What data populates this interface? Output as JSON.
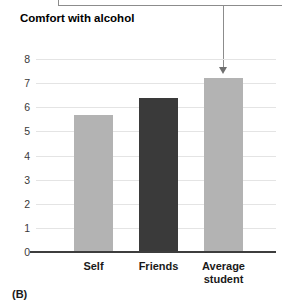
{
  "panel": {
    "label": "(B)"
  },
  "callout": {
    "text": ""
  },
  "chart_data": {
    "type": "bar",
    "title": "Comfort with alcohol",
    "xlabel": "",
    "ylabel": "Comfort with alcohol",
    "categories": [
      "Self",
      "Friends",
      "Average student"
    ],
    "values": [
      5.7,
      6.4,
      7.2
    ],
    "bar_colors": [
      "#b3b3b3",
      "#3a3a3a",
      "#b3b3b3"
    ],
    "ylim": [
      0,
      8
    ],
    "yticks": [
      0,
      1,
      2,
      3,
      4,
      5,
      6,
      7,
      8
    ],
    "ytick_labels": [
      "0",
      "1",
      "2",
      "3",
      "4",
      "5",
      "6",
      "7",
      "8"
    ],
    "grid": true,
    "grid_color": "#e4e4e4",
    "legend": null,
    "annotations": [
      {
        "type": "arrow",
        "target_category": "Average student",
        "direction": "down",
        "color": "#8c8c8c"
      }
    ]
  }
}
